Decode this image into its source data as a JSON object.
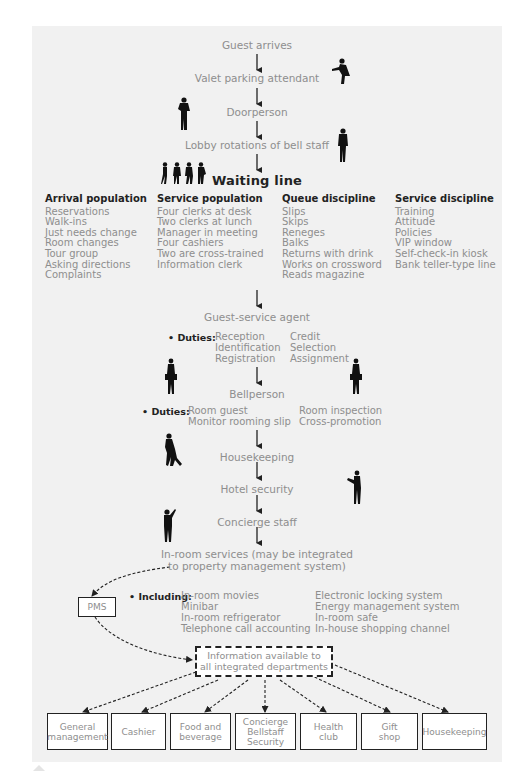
{
  "flow": {
    "guest_arrives": "Guest arrives",
    "valet": "Valet parking attendant",
    "doorperson": "Doorperson",
    "lobby": "Lobby rotations of bell staff",
    "waiting_line": "Waiting line",
    "guest_service_agent": "Guest-service agent",
    "bellperson": "Bellperson",
    "housekeeping": "Housekeeping",
    "hotel_security": "Hotel security",
    "concierge": "Concierge staff",
    "in_room_line1": "In-room services (may be integrated",
    "in_room_line2": "to property management system)"
  },
  "columns": [
    {
      "header": "Arrival population",
      "items": [
        "Reservations",
        "Walk-ins",
        "Just needs change",
        "Room changes",
        "Tour group",
        "Asking directions",
        "Complaints"
      ]
    },
    {
      "header": "Service population",
      "items": [
        "Four clerks at desk",
        "Two clerks at lunch",
        "Manager in meeting",
        "Four cashiers",
        "Two are cross-trained",
        "Information clerk"
      ]
    },
    {
      "header": "Queue discipline",
      "items": [
        "Slips",
        "Skips",
        "Reneges",
        "Balks",
        "Returns with drink",
        "Works on crossword",
        "Reads magazine"
      ]
    },
    {
      "header": "Service discipline",
      "items": [
        "Training",
        "Attitude",
        "Policies",
        "VIP window",
        "Self-check-in kiosk",
        "Bank teller-type line"
      ]
    }
  ],
  "agent_duties": {
    "label": "• Duties:",
    "col1": [
      "Reception",
      "Identification",
      "Registration"
    ],
    "col2": [
      "Credit",
      "Selection",
      "Assignment"
    ]
  },
  "bell_duties": {
    "label": "• Duties:",
    "col1": [
      "Room guest",
      "Monitor rooming slip"
    ],
    "col2": [
      "Room inspection",
      "Cross-promotion"
    ]
  },
  "in_room": {
    "label": "• Including:",
    "col1": [
      "In-room movies",
      "Minibar",
      "In-room refrigerator",
      "Telephone call accounting"
    ],
    "col2": [
      "Electronic locking system",
      "Energy management system",
      "In-room safe",
      "In-house shopping channel"
    ]
  },
  "pms": "PMS",
  "info_box": [
    "Information available to",
    "all integrated departments"
  ],
  "departments": [
    [
      "General",
      "management"
    ],
    [
      "Cashier"
    ],
    [
      "Food and",
      "beverage"
    ],
    [
      "Concierge",
      "Bellstaff",
      "Security"
    ],
    [
      "Health",
      "club"
    ],
    [
      "Gift",
      "shop"
    ],
    [
      "Housekeeping"
    ]
  ],
  "colors": {
    "panel": "#f1f1f1",
    "text": "#8e8e8e",
    "ink": "#222222"
  }
}
